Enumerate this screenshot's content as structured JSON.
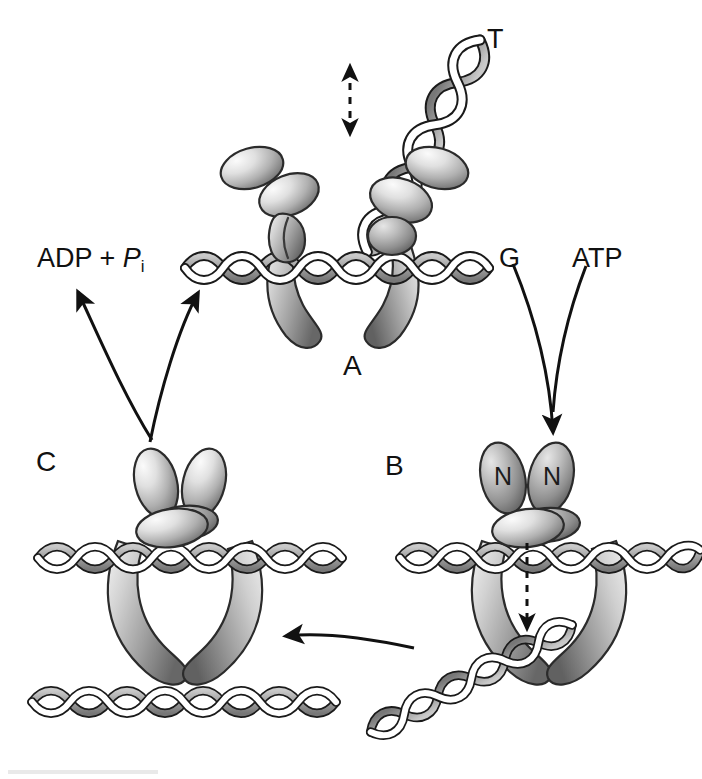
{
  "figure": {
    "background_color": "#ffffff",
    "ink_color": "#111111",
    "protein_fill_light": "#f2f2f2",
    "protein_fill_mid": "#b9b9b9",
    "protein_fill_dark": "#6f6f6f",
    "dna_fill": "#a9a9a9",
    "dna_stroke": "#1a1a1a"
  },
  "labels": {
    "state_a": "A",
    "state_b": "B",
    "state_c": "C",
    "t_segment": "T",
    "g_segment": "G",
    "atp": "ATP",
    "adp_pi_prefix": "ADP + ",
    "adp_pi_p": "P",
    "adp_pi_sub": "i",
    "n_domain_left": "N",
    "n_domain_right": "N"
  },
  "states": [
    {
      "id": "A",
      "name": "open-gate state",
      "label": "A",
      "label_position": {
        "x": 343,
        "y": 352
      },
      "description": "V-shaped open clamp straddling the G-segment DNA; T-segment DNA passes in from upper right; double-headed dashed arrow indicates T-segment capture motion."
    },
    {
      "id": "B",
      "name": "ATP-bound closed state",
      "label": "B",
      "label_position": {
        "x": 385,
        "y": 452
      },
      "description": "N-gate closed by two N domains; T-segment transported downward through the G-segment as shown by the dashed arrow."
    },
    {
      "id": "C",
      "name": "post-passage state",
      "label": "C",
      "label_position": {
        "x": 36,
        "y": 448
      },
      "description": "Closed complex after strand passage; released T-segment DNA lies below the G-segment."
    }
  ],
  "annotations": [
    {
      "id": "t-label",
      "text": "T",
      "x": 487,
      "y": 26,
      "kind": "dna-segment"
    },
    {
      "id": "g-label",
      "text": "G",
      "x": 499,
      "y": 245,
      "kind": "dna-segment"
    },
    {
      "id": "atp-label",
      "text": "ATP",
      "x": 572,
      "y": 245,
      "kind": "substrate"
    },
    {
      "id": "adp-label",
      "text": "ADP + P",
      "x": 37,
      "y": 245,
      "kind": "product"
    },
    {
      "id": "n-left",
      "text": "N",
      "x": 500,
      "y": 472,
      "kind": "domain"
    },
    {
      "id": "n-right",
      "text": "N",
      "x": 549,
      "y": 472,
      "kind": "domain"
    }
  ],
  "arrows": [
    {
      "id": "t-capture-arrow",
      "type": "dashed-double-headed",
      "direction": "vertical",
      "from": [
        350,
        135
      ],
      "to": [
        350,
        62
      ],
      "meaning": "T-segment capture / release motion"
    },
    {
      "id": "atp-binding-arrow",
      "type": "solid-curve-converging",
      "direction": "down-right",
      "from": [
        [
          515,
          262
        ],
        [
          585,
          265
        ]
      ],
      "to": [
        552,
        440
      ],
      "meaning": "ATP binding and G-segment engagement drive A to B"
    },
    {
      "id": "adp-release-arrow",
      "type": "solid-curve",
      "direction": "up-left",
      "from": [
        152,
        440
      ],
      "to": [
        78,
        286
      ],
      "meaning": "ADP + Pi release"
    },
    {
      "id": "c-to-a-arrow",
      "type": "solid-curve",
      "direction": "up-right",
      "from": [
        152,
        440
      ],
      "to": [
        197,
        288
      ],
      "meaning": "C returns to A, resetting the clamp"
    },
    {
      "id": "b-to-c-arrow",
      "type": "solid-curve",
      "direction": "left",
      "from": [
        412,
        645
      ],
      "to": [
        282,
        637
      ],
      "meaning": "Strand passage completes, B to C"
    }
  ]
}
